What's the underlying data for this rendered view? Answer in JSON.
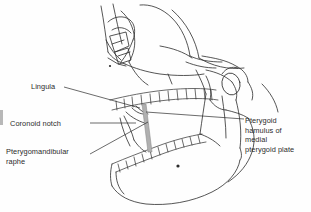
{
  "figure": {
    "kind": "anatomical-line-drawing",
    "background_color": "#fefefe",
    "ink_color": "#2b2b2b",
    "raphe_color": "#b0b0b0"
  },
  "labels": {
    "lingula": "Lingula",
    "coronoid_notch": "Coronoid notch",
    "pterygomandibular_raphe": "Pterygomandibular\nraphe",
    "pterygoid_hamulus": "Pterygoid\nhamulus of\nmedial\npterygoid plate"
  }
}
